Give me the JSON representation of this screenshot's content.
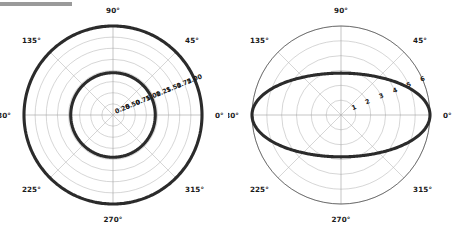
{
  "figure": {
    "background_color": "#ffffff",
    "grid_color": "#b4b4b4",
    "curve_color": "#2b2b2b",
    "label_color": "#1a1a1a",
    "top_bar_color": "#9a9a9a"
  },
  "panels": [
    {
      "name": "left-polar-plot",
      "center_x": 113,
      "center_y": 115,
      "outer_radius_px": 89,
      "angular_labels": [
        "0°",
        "45°",
        "90°",
        "135°",
        "180°",
        "225°",
        "270°",
        "315°"
      ],
      "angular_values": [
        0,
        45,
        90,
        135,
        180,
        225,
        270,
        315
      ],
      "radial_labels": [
        "0.25",
        "0.50",
        "0.75",
        "1.00",
        "1.25",
        "1.50",
        "1.75",
        "2.00"
      ],
      "radial_values": [
        0.25,
        0.5,
        0.75,
        1.0,
        1.25,
        1.5,
        1.75,
        2.0
      ],
      "radial_label_angle_deg": 22.5,
      "rmax": 2.0,
      "curves": [
        {
          "name": "outer-circle-curve",
          "type": "constant-radius",
          "r": 2.0
        },
        {
          "name": "inner-circle-curve",
          "type": "constant-radius",
          "r": 0.95
        }
      ]
    },
    {
      "name": "right-polar-plot",
      "center_x": 341,
      "center_y": 115,
      "outer_radius_px": 89,
      "angular_labels": [
        "0°",
        "45°",
        "90°",
        "135°",
        "180°",
        "225°",
        "270°",
        "315°"
      ],
      "angular_values": [
        0,
        45,
        90,
        135,
        180,
        225,
        270,
        315
      ],
      "radial_labels": [
        "1",
        "2",
        "3",
        "4",
        "5",
        "6"
      ],
      "radial_values": [
        1,
        2,
        3,
        4,
        5,
        6
      ],
      "radial_label_angle_deg": 22.5,
      "rmax": 6.0,
      "curves": [
        {
          "name": "ellipse-curve",
          "type": "ellipse",
          "semi_major": 6.0,
          "semi_minor": 2.82
        }
      ]
    }
  ],
  "chart_data": {
    "type": "line",
    "title": "",
    "subplots": [
      {
        "title": "",
        "projection": "polar",
        "theta_ticks_deg": [
          0,
          45,
          90,
          135,
          180,
          225,
          270,
          315
        ],
        "theta_tick_labels": [
          "0°",
          "45°",
          "90°",
          "135°",
          "180°",
          "225°",
          "270°",
          "315°"
        ],
        "r_ticks": [
          0.25,
          0.5,
          0.75,
          1.0,
          1.25,
          1.5,
          1.75,
          2.0
        ],
        "r_tick_labels": [
          "0.25",
          "0.50",
          "0.75",
          "1.00",
          "1.25",
          "1.50",
          "1.75",
          "2.00"
        ],
        "rlim": [
          0,
          2.0
        ],
        "grid": true,
        "legend": "none",
        "series": [
          {
            "name": "outer circle",
            "r_constant": 2.0,
            "theta_range_deg": [
              0,
              360
            ]
          },
          {
            "name": "inner circle",
            "r_constant": 0.95,
            "theta_range_deg": [
              0,
              360
            ]
          }
        ]
      },
      {
        "title": "",
        "projection": "polar",
        "theta_ticks_deg": [
          0,
          45,
          90,
          135,
          180,
          225,
          270,
          315
        ],
        "theta_tick_labels": [
          "0°",
          "45°",
          "90°",
          "135°",
          "180°",
          "225°",
          "270°",
          "315°"
        ],
        "r_ticks": [
          1,
          2,
          3,
          4,
          5,
          6
        ],
        "r_tick_labels": [
          "1",
          "2",
          "3",
          "4",
          "5",
          "6"
        ],
        "rlim": [
          0,
          6.0
        ],
        "grid": true,
        "legend": "none",
        "series": [
          {
            "name": "ellipse",
            "semi_major_a": 6.0,
            "semi_minor_b": 2.82,
            "theta_range_deg": [
              0,
              360
            ]
          }
        ]
      }
    ]
  }
}
